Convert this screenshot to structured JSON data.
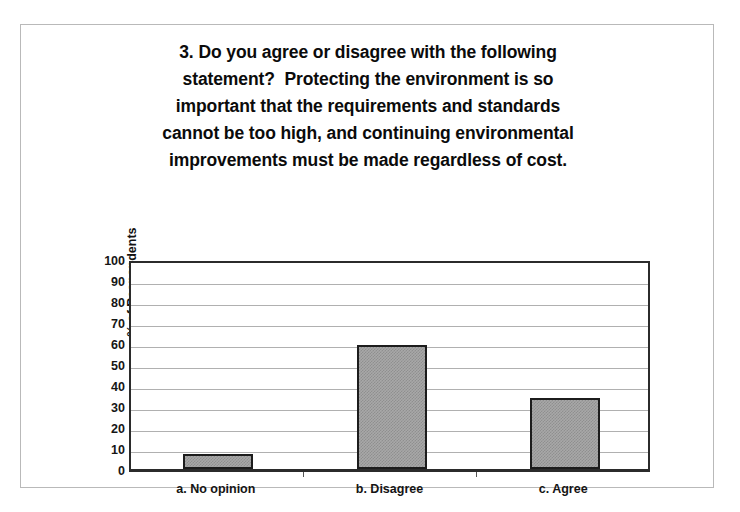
{
  "title_lines": [
    "3. Do you agree or disagree with the following",
    "statement?  Protecting the environment is so",
    "important that the requirements and standards",
    "cannot be too high, and continuing environmental",
    "improvements must be made regardless of cost."
  ],
  "chart_data": {
    "type": "bar",
    "categories": [
      "a. No opinion",
      "b. Disagree",
      "c. Agree"
    ],
    "values": [
      7,
      59,
      34
    ],
    "xlabel": "",
    "ylabel": "% of Respondents",
    "ylim": [
      0,
      100
    ],
    "ytick_step": 10,
    "yticks": [
      100,
      90,
      80,
      70,
      60,
      50,
      40,
      30,
      20,
      10,
      0
    ],
    "grid": true,
    "legend": false,
    "series": [
      {
        "name": "% of Respondents",
        "values": [
          7,
          59,
          34
        ],
        "fill": "#a0a0a0",
        "pattern": "checker-dither",
        "border": "#1c1c1c"
      }
    ],
    "colors": {
      "bar_fill": "#a0a0a0",
      "bar_border": "#1c1c1c",
      "grid": "#b0b0b0",
      "axis": "#2b2b2b",
      "text": "#111111",
      "page_border": "#b9b9b9",
      "background": "#ffffff"
    }
  }
}
